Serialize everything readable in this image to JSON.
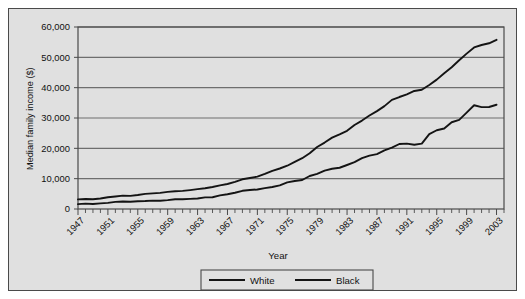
{
  "chart_data": {
    "type": "line",
    "title": "",
    "xlabel": "Year",
    "ylabel": "Median family income ($)",
    "xlim": [
      1947,
      2004
    ],
    "ylim": [
      0,
      60000
    ],
    "grid": true,
    "legend_position": "bottom-center",
    "ytick_labels": [
      "60,000",
      "50,000",
      "40,000",
      "30,000",
      "20,000",
      "10,000",
      "0"
    ],
    "ytick_values": [
      60000,
      50000,
      40000,
      30000,
      20000,
      10000,
      0
    ],
    "xtick_labels": [
      "1947",
      "1951",
      "1955",
      "1959",
      "1963",
      "1967",
      "1971",
      "1975",
      "1979",
      "1983",
      "1987",
      "1991",
      "1995",
      "1999",
      "2003"
    ],
    "xtick_values": [
      1947,
      1951,
      1955,
      1959,
      1963,
      1967,
      1971,
      1975,
      1979,
      1983,
      1987,
      1991,
      1995,
      1999,
      2003
    ],
    "x": [
      1947,
      1948,
      1949,
      1950,
      1951,
      1952,
      1953,
      1954,
      1955,
      1956,
      1957,
      1958,
      1959,
      1960,
      1961,
      1962,
      1963,
      1964,
      1965,
      1966,
      1967,
      1968,
      1969,
      1970,
      1971,
      1972,
      1973,
      1974,
      1975,
      1976,
      1977,
      1978,
      1979,
      1980,
      1981,
      1982,
      1983,
      1984,
      1985,
      1986,
      1987,
      1988,
      1989,
      1990,
      1991,
      1992,
      1993,
      1994,
      1995,
      1996,
      1997,
      1998,
      1999,
      2000,
      2001,
      2002,
      2003
    ],
    "series": [
      {
        "name": "White",
        "color": "#141414",
        "values": [
          3157,
          3310,
          3232,
          3445,
          3859,
          4114,
          4392,
          4339,
          4605,
          4993,
          5166,
          5300,
          5643,
          5835,
          5981,
          6237,
          6548,
          6858,
          7251,
          7792,
          8234,
          8937,
          9794,
          10236,
          10672,
          11549,
          12595,
          13356,
          14268,
          15537,
          16740,
          18368,
          20439,
          21904,
          23517,
          24603,
          25757,
          27686,
          29152,
          30809,
          32274,
          33915,
          35975,
          36915,
          37783,
          38909,
          39300,
          40884,
          42646,
          44756,
          46754,
          49023,
          51224,
          53256,
          54067,
          54633,
          55768
        ]
      },
      {
        "name": "Black",
        "color": "#141414",
        "values": [
          1614,
          1768,
          1650,
          1869,
          2032,
          2338,
          2461,
          2410,
          2549,
          2628,
          2764,
          2711,
          2917,
          3233,
          3191,
          3330,
          3465,
          3839,
          3886,
          4507,
          4875,
          5360,
          5999,
          6279,
          6440,
          6864,
          7269,
          7808,
          8779,
          9242,
          9563,
          10879,
          11574,
          12674,
          13266,
          13598,
          14506,
          15432,
          16786,
          17604,
          18098,
          19329,
          20209,
          21423,
          21548,
          21161,
          21542,
          24698,
          25970,
          26522,
          28602,
          29404,
          31778,
          34192,
          33598,
          33634,
          34369
        ]
      }
    ],
    "legend": [
      {
        "label": "White",
        "color": "#141414"
      },
      {
        "label": "Black",
        "color": "#141414"
      }
    ],
    "colors": {
      "panel_background": "#e0e0e0",
      "plot_background": "#e0e0e0",
      "border": "#4a4a4a",
      "gridline": "#6e6e6e",
      "line": "#141414",
      "text": "#111111"
    }
  }
}
